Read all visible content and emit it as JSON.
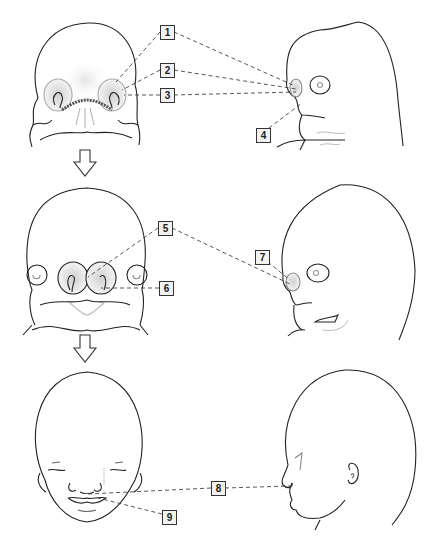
{
  "figure": {
    "stages": [
      {
        "name": "early-embryo-face",
        "views": [
          "frontal",
          "lateral"
        ]
      },
      {
        "name": "later-embryo-face",
        "views": [
          "frontal",
          "lateral"
        ]
      },
      {
        "name": "fetal-face",
        "views": [
          "frontal",
          "lateral"
        ]
      }
    ],
    "arrows": [
      "stage-1-to-2",
      "stage-2-to-3"
    ],
    "labels": [
      {
        "id": "1",
        "text": "1",
        "x": 160,
        "y": 25
      },
      {
        "id": "2",
        "text": "2",
        "x": 160,
        "y": 63
      },
      {
        "id": "3",
        "text": "3",
        "x": 160,
        "y": 88
      },
      {
        "id": "4",
        "text": "4",
        "x": 256,
        "y": 128
      },
      {
        "id": "5",
        "text": "5",
        "x": 158,
        "y": 221
      },
      {
        "id": "6",
        "text": "6",
        "x": 159,
        "y": 281
      },
      {
        "id": "7",
        "text": "7",
        "x": 255,
        "y": 250
      },
      {
        "id": "8",
        "text": "8",
        "x": 211,
        "y": 481
      },
      {
        "id": "9",
        "text": "9",
        "x": 162,
        "y": 510
      }
    ]
  },
  "colors": {
    "line": "#222222",
    "leader": "#444444",
    "label_bg": "#f2f2f2",
    "shade": "#d8d8d8"
  }
}
